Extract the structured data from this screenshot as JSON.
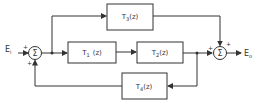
{
  "diagram": {
    "type": "block-diagram",
    "input": {
      "label": "E",
      "sub": "i"
    },
    "output": {
      "label": "E",
      "sub": "o"
    },
    "summing_junctions": [
      {
        "id": "sum1",
        "symbol": "Σ",
        "signs": [
          "+",
          "+"
        ]
      },
      {
        "id": "sum2",
        "symbol": "Σ",
        "signs": [
          "+",
          "+"
        ]
      }
    ],
    "blocks": [
      {
        "id": "T1",
        "name": "T",
        "sub": "1",
        "arg": "(z)"
      },
      {
        "id": "T2",
        "name": "T",
        "sub": "2",
        "arg": "(z)"
      },
      {
        "id": "T3",
        "name": "T",
        "sub": "3",
        "arg": "(z)"
      },
      {
        "id": "T4",
        "name": "T",
        "sub": "4",
        "arg": "(z)"
      }
    ],
    "colors": {
      "line": "#333333",
      "background": "#ffffff"
    }
  }
}
